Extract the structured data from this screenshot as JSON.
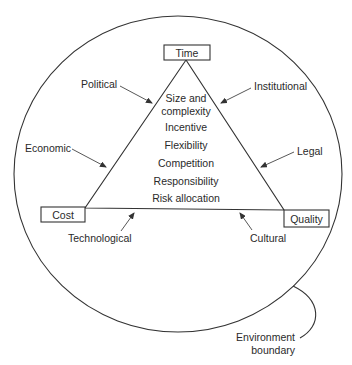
{
  "diagram": {
    "title": "",
    "vertices": {
      "top": "Time",
      "left": "Cost",
      "right": "Quality"
    },
    "inner_factors": [
      "Size and",
      "complexity",
      "Incentive",
      "Flexibility",
      "Competition",
      "Responsibility",
      "Risk allocation"
    ],
    "external_influences": {
      "political": "Political",
      "institutional": "Institutional",
      "economic": "Economic",
      "legal": "Legal",
      "technological": "Technological",
      "cultural": "Cultural"
    },
    "boundary_label": {
      "line1": "Environment",
      "line2": "boundary"
    },
    "colors": {
      "line": "#333333",
      "text": "#2a2a2a",
      "background": "#ffffff"
    }
  }
}
